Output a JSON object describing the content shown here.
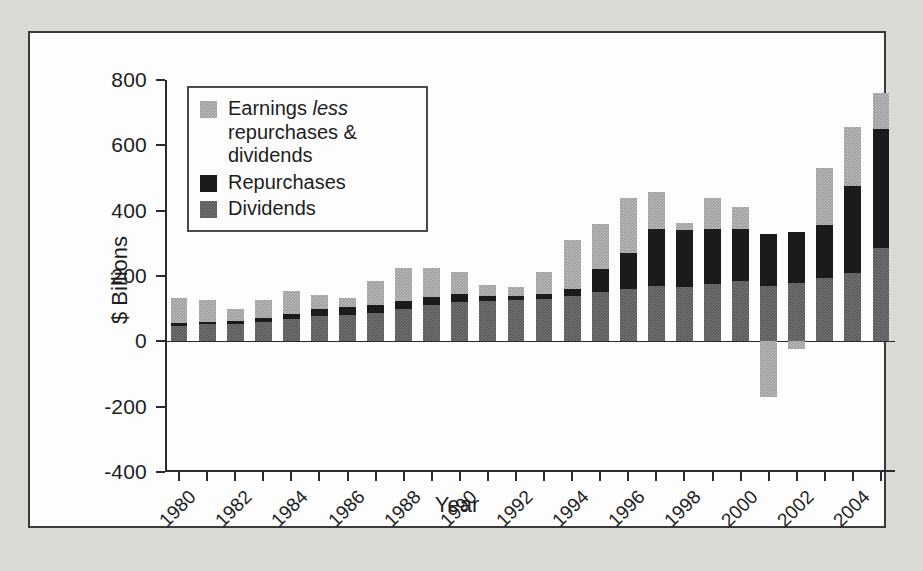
{
  "chart_data": {
    "type": "bar",
    "subtype": "stacked-bar",
    "title": "",
    "xlabel": "Year",
    "ylabel": "$ Billions",
    "ylim": [
      -400,
      800
    ],
    "y_ticks": [
      800,
      600,
      400,
      200,
      0,
      -200,
      -400
    ],
    "y_tick_labels": [
      "800",
      "600",
      "400",
      "200",
      "0",
      "-200",
      "-400"
    ],
    "grid": false,
    "legend_position": "upper-left-inside",
    "x": [
      1980,
      1981,
      1982,
      1983,
      1984,
      1985,
      1986,
      1987,
      1988,
      1989,
      1990,
      1991,
      1992,
      1993,
      1994,
      1995,
      1996,
      1997,
      1998,
      1999,
      2000,
      2001,
      2002,
      2003,
      2004,
      2005
    ],
    "categories": [
      "1980",
      "1981",
      "1982",
      "1983",
      "1984",
      "1985",
      "1986",
      "1987",
      "1988",
      "1989",
      "1990",
      "1991",
      "1992",
      "1993",
      "1994",
      "1995",
      "1996",
      "1997",
      "1998",
      "1999",
      "2000",
      "2001",
      "2002",
      "2003",
      "2004",
      "2005"
    ],
    "x_tick_labels": [
      "1980",
      "1982",
      "1984",
      "1986",
      "1988",
      "1990",
      "1992",
      "1994",
      "1996",
      "1998",
      "2000",
      "2002",
      "2004"
    ],
    "x_tick_label_rotation": -45,
    "series": [
      {
        "name": "Dividends",
        "color": "#585858",
        "values": [
          48,
          52,
          53,
          60,
          68,
          78,
          82,
          88,
          100,
          110,
          120,
          123,
          126,
          130,
          140,
          150,
          160,
          170,
          165,
          175,
          185,
          170,
          180,
          195,
          210,
          285
        ]
      },
      {
        "name": "Repurchases",
        "color": "#1b1b1b",
        "values": [
          8,
          8,
          10,
          10,
          16,
          22,
          22,
          22,
          24,
          26,
          24,
          16,
          14,
          16,
          20,
          70,
          110,
          175,
          175,
          170,
          160,
          160,
          155,
          160,
          265,
          365
        ]
      },
      {
        "name": "Earnings less repurchases & dividends",
        "color": "#9c9c9c",
        "values": [
          78,
          68,
          37,
          58,
          70,
          42,
          28,
          75,
          100,
          90,
          68,
          33,
          26,
          66,
          150,
          138,
          168,
          113,
          23,
          95,
          66,
          -170,
          -25,
          175,
          182,
          110
        ]
      }
    ],
    "stack_totals": [
      134,
      128,
      100,
      128,
      154,
      142,
      132,
      185,
      224,
      226,
      212,
      172,
      166,
      212,
      310,
      358,
      438,
      458,
      363,
      440,
      411,
      330,
      335,
      530,
      657,
      760
    ]
  },
  "legend": {
    "items": [
      {
        "label_prefix": "Earnings ",
        "label_italic": "less",
        "label_suffix": " repurchases & dividends",
        "swatch": "earnings-swatch"
      },
      {
        "label": "Repurchases",
        "swatch": "repurchases-swatch"
      },
      {
        "label": "Dividends",
        "swatch": "dividends-swatch"
      }
    ]
  },
  "axes": {
    "y_title": "$ Billions",
    "x_title": "Year"
  },
  "colors": {
    "earnings": "#9c9c9c",
    "repurchases": "#1b1b1b",
    "dividends": "#585858",
    "axis": "#2b2b2b",
    "panel_background": "#fdfdfd",
    "mat_background": "#d9d9d5",
    "frame_border": "#3a3a3a"
  }
}
